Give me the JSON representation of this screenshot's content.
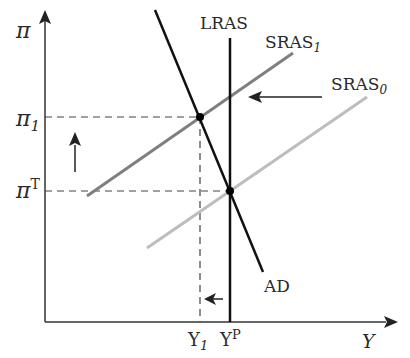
{
  "diagram": {
    "type": "economics-AD-AS",
    "axes": {
      "y_label": "π",
      "x_label": "Y"
    },
    "y_ticks": [
      {
        "label": "π",
        "sub": "1",
        "sup": ""
      },
      {
        "label": "π",
        "sub": "",
        "sup": "T"
      }
    ],
    "x_ticks": [
      {
        "label": "Y",
        "sub": "1",
        "sup": ""
      },
      {
        "label": "Y",
        "sub": "",
        "sup": "P"
      }
    ],
    "curves": {
      "lras": "LRAS",
      "sras1": {
        "label": "SRAS",
        "sub": "1"
      },
      "sras0": {
        "label": "SRAS",
        "sub": "0"
      },
      "ad": "AD"
    },
    "colors": {
      "axis": "#333333",
      "lras": "#111111",
      "ad": "#111111",
      "sras1": "#7f7f7f",
      "sras0": "#bdbdbd",
      "dashed": "#444444",
      "arrow": "#222222"
    },
    "annotations": [
      "arrow-left-sras-shift",
      "arrow-up-inflation",
      "arrow-left-output"
    ]
  }
}
